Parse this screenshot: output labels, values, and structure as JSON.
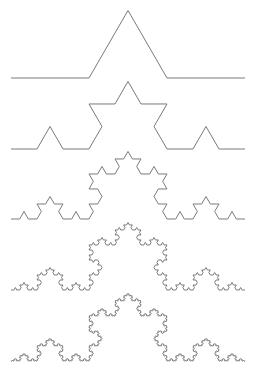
{
  "diagram": {
    "title": "",
    "background": "#ffffff",
    "stroke_color": "#7a7a7a",
    "stroke_width": 1,
    "x_start": 11,
    "x_end": 245,
    "curves": [
      {
        "label": "iteration-1",
        "depth": 1,
        "baseline_y": 78
      },
      {
        "label": "iteration-2",
        "depth": 2,
        "baseline_y": 149
      },
      {
        "label": "iteration-3",
        "depth": 3,
        "baseline_y": 219
      },
      {
        "label": "iteration-4",
        "depth": 4,
        "baseline_y": 290
      },
      {
        "label": "iteration-5",
        "depth": 5,
        "baseline_y": 361
      }
    ]
  }
}
